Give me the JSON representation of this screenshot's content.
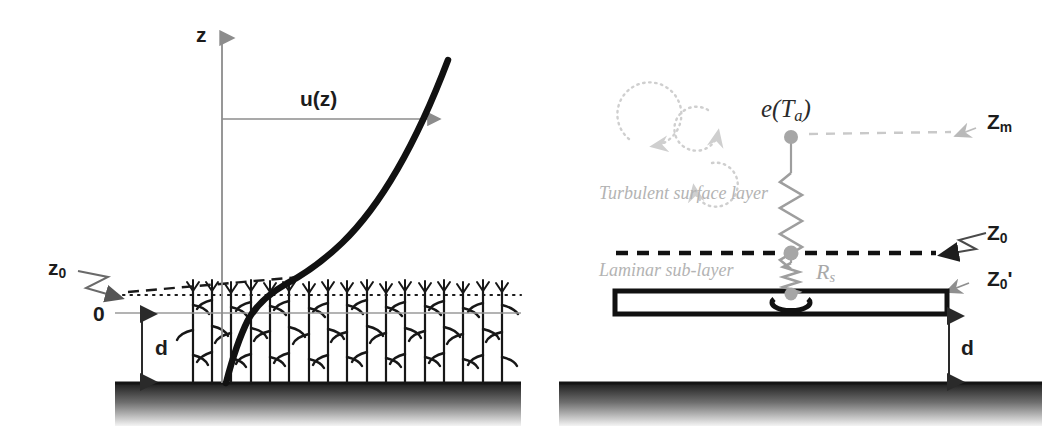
{
  "figure": {
    "type": "diagram",
    "title": "",
    "panels": [
      "wind-profile-over-canopy",
      "resistance-network-leaf"
    ],
    "background_color": "#ffffff"
  },
  "left_panel": {
    "name": "wind profile over a crop canopy",
    "axis": {
      "vertical_label": "z",
      "origin_label": "0",
      "axis_color": "#8c8c8c"
    },
    "profile_curve": {
      "label": "u(z)",
      "color": "#111111",
      "description": "logarithmic wind speed profile increasing with height"
    },
    "annotations": [
      {
        "label": "z",
        "sub": "",
        "name": "z-axis-label"
      },
      {
        "label": "u(z)",
        "sub": "",
        "name": "u-of-z-label"
      },
      {
        "label": "z",
        "sub": "0",
        "name": "roughness-length-label"
      },
      {
        "label": "0",
        "sub": "",
        "name": "zero-reference-label"
      },
      {
        "label": "d",
        "sub": "",
        "name": "displacement-height-label"
      }
    ],
    "lines": {
      "dotted_z0_level": "#1a1a1a",
      "dashed_profile_tangent": "#1a1a1a",
      "baseline_zero": "#9a9a9a"
    },
    "canopy": {
      "plant_count": 17,
      "stem_color": "#1a1a1a",
      "description": "row of maize-like plants with vertical stems and drooping leaves"
    },
    "ground": {
      "top_line_color": "#141414",
      "gradient_from": "#202020",
      "gradient_to": "#f2f2f2"
    }
  },
  "right_panel": {
    "name": "resistance network between leaf surface and air",
    "source_label": "e(T",
    "source_sub": "a",
    "source_close": ")",
    "resistance_label": "R",
    "resistance_sub": "s",
    "layers": [
      {
        "label": "Turbulent surface layer",
        "color": "#bdbdbd",
        "name": "turbulent-surface-layer-label"
      },
      {
        "label": "Laminar sub-layer",
        "color": "#bdbdbd",
        "name": "laminar-sub-layer-label"
      }
    ],
    "height_markers": [
      {
        "label": "Z",
        "sub": "m",
        "name": "measurement-height-label"
      },
      {
        "label": "Z",
        "sub": "0",
        "name": "roughness-length-label"
      },
      {
        "label": "Z",
        "sub": "0",
        "suffix": "'",
        "name": "scalar-roughness-length-label"
      },
      {
        "label": "d",
        "sub": "",
        "name": "displacement-height-label"
      }
    ],
    "lines": {
      "zm_dashed": "#c9c9c9",
      "z0_dashed": "#111111",
      "network_color": "#9e9e9e"
    },
    "eddies": {
      "count": 3,
      "color": "#cfcfcf",
      "style": "dotted circular arrows"
    },
    "leaf_plate": {
      "outline_color": "#111111",
      "fill_color": "#ffffff",
      "stoma_color": "#111111"
    },
    "ground": {
      "top_line_color": "#141414",
      "gradient_from": "#202020",
      "gradient_to": "#f2f2f2"
    }
  }
}
